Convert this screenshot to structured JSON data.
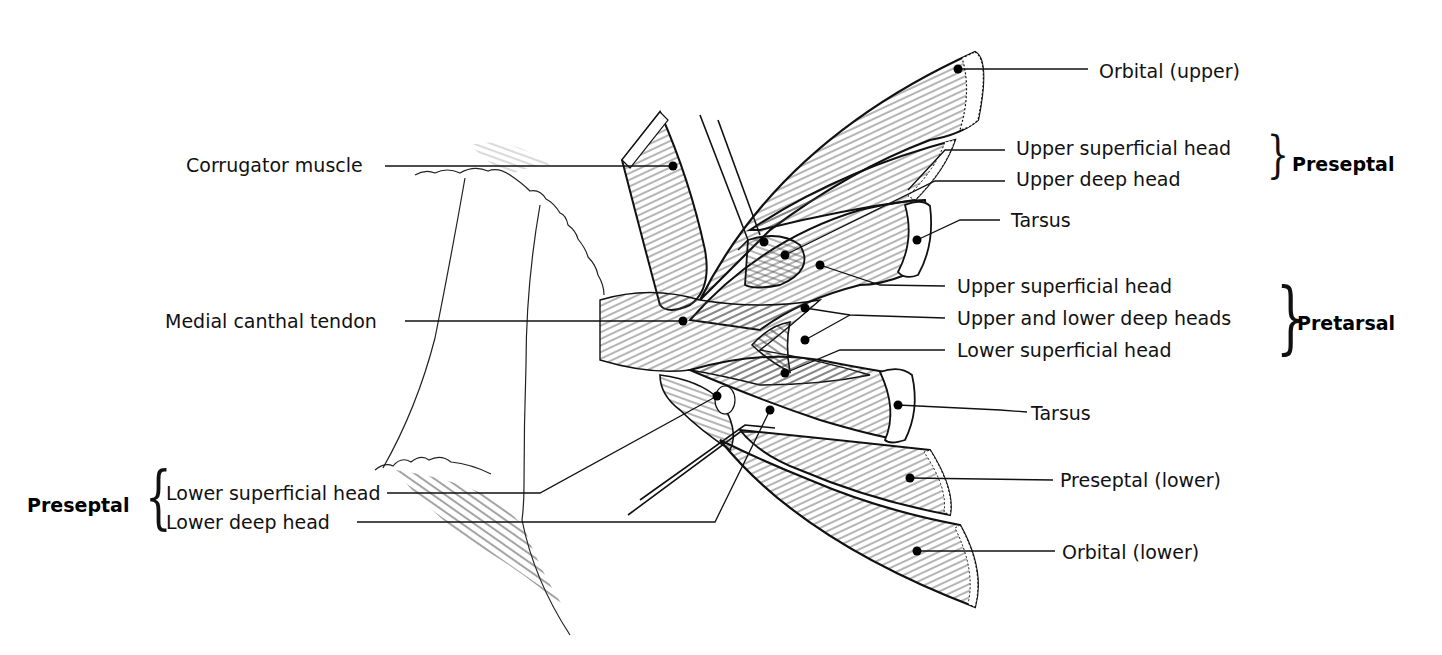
{
  "figure": {
    "labels": {
      "orbital_upper": "Orbital (upper)",
      "upper_superficial_head_preseptal": "Upper superficial head",
      "upper_deep_head": "Upper deep head",
      "tarsus_upper": "Tarsus",
      "upper_superficial_head_pretarsal": "Upper superficial head",
      "upper_and_lower_deep_heads": "Upper and lower deep heads",
      "lower_superficial_head_pretarsal": "Lower superficial head",
      "tarsus_lower": "Tarsus",
      "preseptal_lower": "Preseptal (lower)",
      "orbital_lower": "Orbital (lower)",
      "corrugator_muscle": "Corrugator muscle",
      "medial_canthal_tendon": "Medial canthal tendon",
      "lower_superficial_head_preseptal": "Lower superficial head",
      "lower_deep_head": "Lower deep head"
    },
    "groups": {
      "preseptal_upper": "Preseptal",
      "pretarsal": "Pretarsal",
      "preseptal_lower": "Preseptal"
    },
    "braces": {
      "right": "}",
      "left": "{"
    }
  }
}
